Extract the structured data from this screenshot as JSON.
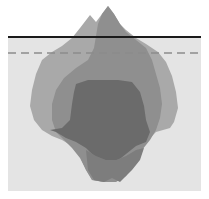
{
  "diagram": {
    "type": "iceberg",
    "title": "",
    "colors": {
      "background": "#ffffff",
      "water": "#e4e4e4",
      "waterline": "#1a1a1a",
      "dashed_line": "#8c8c8c",
      "layer_outer": "#a9a9a9",
      "layer_middle": "#8f8f8f",
      "layer_inner": "#6b6b6b"
    },
    "lines": [
      {
        "kind": "solid",
        "label": "waterline",
        "y": 37
      },
      {
        "kind": "dashed",
        "label": "below-surface",
        "y": 53
      }
    ],
    "layers": [
      {
        "name": "outer"
      },
      {
        "name": "middle"
      },
      {
        "name": "inner"
      }
    ]
  }
}
